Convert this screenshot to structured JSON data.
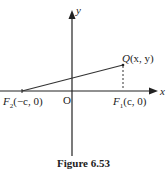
{
  "figure": {
    "caption": "Figure 6.53",
    "axes": {
      "x_label": "x",
      "y_label": "y",
      "origin_label": "O"
    },
    "points": {
      "Q": {
        "name": "Q",
        "coords": "(x, y)"
      },
      "F1": {
        "name": "F",
        "sub": "1",
        "coords": "(c, 0)"
      },
      "F2": {
        "name": "F",
        "sub": "2",
        "coords": "(−c, 0)"
      }
    },
    "line_color": "#333333"
  }
}
